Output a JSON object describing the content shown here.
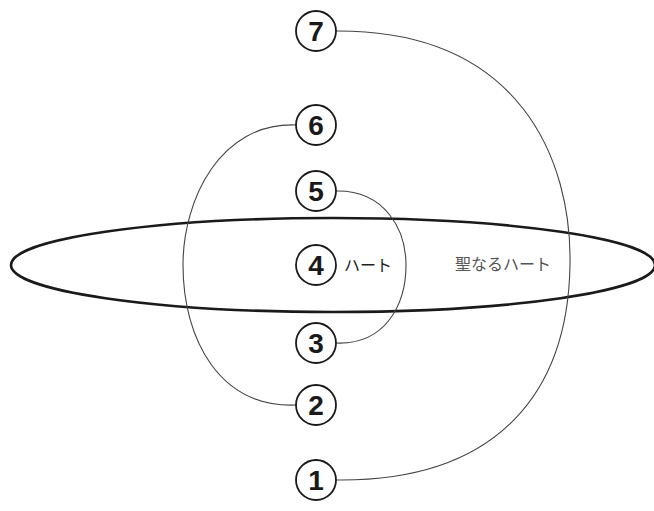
{
  "diagram": {
    "ellipse": {
      "label": "聖なるハート",
      "cx": 333,
      "cy": 265,
      "rx": 322,
      "ry": 48
    },
    "nodes": [
      {
        "num": "7",
        "cy": 31
      },
      {
        "num": "6",
        "cy": 125
      },
      {
        "num": "5",
        "cy": 191
      },
      {
        "num": "4",
        "cy": 265,
        "label": "ハート"
      },
      {
        "num": "3",
        "cy": 343
      },
      {
        "num": "2",
        "cy": 405
      },
      {
        "num": "1",
        "cy": 480
      }
    ],
    "connections": [
      {
        "from": "7",
        "to": "1",
        "side": "right"
      },
      {
        "from": "6",
        "to": "2",
        "side": "left"
      },
      {
        "from": "5",
        "to": "3",
        "side": "right"
      }
    ],
    "colors": {
      "stroke": "#1a1a1a",
      "arc": "#444444",
      "background": "#ffffff"
    }
  }
}
